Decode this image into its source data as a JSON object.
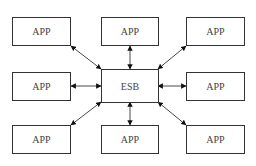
{
  "diagram": {
    "hub": {
      "label": "ESB"
    },
    "nodes": [
      {
        "id": "app-top-left",
        "label": "APP"
      },
      {
        "id": "app-top-center",
        "label": "APP"
      },
      {
        "id": "app-top-right",
        "label": "APP"
      },
      {
        "id": "app-middle-left",
        "label": "APP"
      },
      {
        "id": "app-middle-right",
        "label": "APP"
      },
      {
        "id": "app-bottom-left",
        "label": "APP"
      },
      {
        "id": "app-bottom-center",
        "label": "APP"
      },
      {
        "id": "app-bottom-right",
        "label": "APP"
      }
    ],
    "edges": [
      {
        "from": "app-top-left",
        "to": "ESB",
        "type": "bidirectional"
      },
      {
        "from": "app-top-center",
        "to": "ESB",
        "type": "bidirectional"
      },
      {
        "from": "app-top-right",
        "to": "ESB",
        "type": "bidirectional"
      },
      {
        "from": "app-middle-left",
        "to": "ESB",
        "type": "bidirectional"
      },
      {
        "from": "app-middle-right",
        "to": "ESB",
        "type": "bidirectional"
      },
      {
        "from": "app-bottom-left",
        "to": "ESB",
        "type": "bidirectional"
      },
      {
        "from": "app-bottom-center",
        "to": "ESB",
        "type": "bidirectional"
      },
      {
        "from": "app-bottom-right",
        "to": "ESB",
        "type": "bidirectional"
      }
    ],
    "colors": {
      "stroke": "#333333",
      "text": "#444444",
      "background": "#ffffff"
    }
  }
}
